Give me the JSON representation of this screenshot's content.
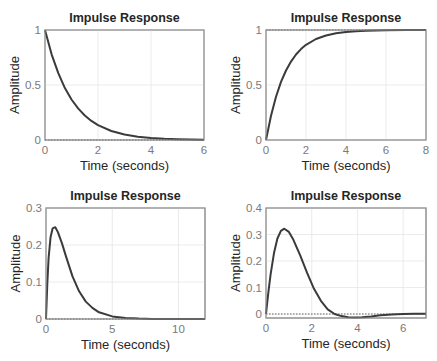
{
  "chart_data": [
    {
      "type": "line",
      "title": "Impulse Response",
      "xlabel": "Time (seconds)",
      "ylabel": "Amplitude",
      "xlim": [
        0,
        6
      ],
      "ylim": [
        0,
        1
      ],
      "xticks": [
        0,
        2,
        4,
        6
      ],
      "yticks": [
        0,
        0.5,
        1
      ],
      "ytick_labels": [
        "0",
        "0.5",
        "1"
      ],
      "grid": true,
      "reference_line": 0,
      "box": {
        "left": 45,
        "top": 30,
        "right": 204,
        "bottom": 140
      },
      "series": [
        {
          "name": "impulse",
          "x": [
            0,
            0.25,
            0.5,
            0.75,
            1,
            1.25,
            1.5,
            1.75,
            2,
            2.5,
            3,
            3.5,
            4,
            4.5,
            5,
            5.5,
            6
          ],
          "values": [
            1,
            0.779,
            0.607,
            0.472,
            0.368,
            0.287,
            0.223,
            0.174,
            0.135,
            0.082,
            0.05,
            0.03,
            0.018,
            0.011,
            0.007,
            0.004,
            0.002
          ]
        }
      ]
    },
    {
      "type": "line",
      "title": "Impulse Response",
      "xlabel": "Time (seconds)",
      "ylabel": "Amplitude",
      "xlim": [
        0,
        8
      ],
      "ylim": [
        0,
        1
      ],
      "xticks": [
        0,
        2,
        4,
        6,
        8
      ],
      "yticks": [
        0,
        0.5,
        1
      ],
      "ytick_labels": [
        "0",
        "0.5",
        "1"
      ],
      "grid": true,
      "reference_line": 1,
      "box": {
        "left": 266,
        "top": 30,
        "right": 426,
        "bottom": 140
      },
      "series": [
        {
          "name": "impulse",
          "x": [
            0,
            0.25,
            0.5,
            0.75,
            1,
            1.25,
            1.5,
            1.75,
            2,
            2.5,
            3,
            3.5,
            4,
            4.5,
            5,
            6,
            7,
            8
          ],
          "values": [
            0,
            0.221,
            0.393,
            0.528,
            0.632,
            0.713,
            0.777,
            0.826,
            0.865,
            0.918,
            0.95,
            0.97,
            0.982,
            0.989,
            0.993,
            0.998,
            0.999,
            1
          ]
        }
      ]
    },
    {
      "type": "line",
      "title": "Impulse Response",
      "xlabel": "Time (seconds)",
      "ylabel": "Amplitude",
      "xlim": [
        0,
        12
      ],
      "ylim": [
        0,
        0.3
      ],
      "xticks": [
        0,
        5,
        10
      ],
      "yticks": [
        0,
        0.1,
        0.2,
        0.3
      ],
      "ytick_labels": [
        "0",
        "0.1",
        "0.2",
        "0.3"
      ],
      "grid": true,
      "reference_line": 0,
      "box": {
        "left": 46,
        "top": 208,
        "right": 205,
        "bottom": 319
      },
      "series": [
        {
          "name": "impulse",
          "x": [
            0,
            0.1,
            0.2,
            0.35,
            0.5,
            0.7,
            0.9,
            1.2,
            1.5,
            2,
            2.5,
            3,
            3.5,
            4,
            5,
            6,
            7,
            8,
            10,
            12
          ],
          "values": [
            0,
            0.095,
            0.165,
            0.222,
            0.245,
            0.248,
            0.235,
            0.205,
            0.17,
            0.115,
            0.075,
            0.047,
            0.03,
            0.018,
            0.007,
            0.003,
            0.001,
            0,
            0,
            0
          ]
        }
      ]
    },
    {
      "type": "line",
      "title": "Impulse Response",
      "xlabel": "Time (seconds)",
      "ylabel": "Amplitude",
      "xlim": [
        0,
        7
      ],
      "ylim": [
        -0.015,
        0.4
      ],
      "xticks": [
        0,
        2,
        4,
        6
      ],
      "yticks": [
        0,
        0.1,
        0.2,
        0.3,
        0.4
      ],
      "ytick_labels": [
        "0",
        "0.1",
        "0.2",
        "0.3",
        "0.4"
      ],
      "grid": true,
      "reference_line": 0,
      "box": {
        "left": 266,
        "top": 208,
        "right": 426,
        "bottom": 318
      },
      "series": [
        {
          "name": "impulse",
          "x": [
            0,
            0.1,
            0.2,
            0.35,
            0.5,
            0.65,
            0.8,
            1,
            1.2,
            1.5,
            1.8,
            2.1,
            2.4,
            2.7,
            3,
            3.3,
            3.6,
            3.9,
            4.2,
            4.6,
            5,
            5.5,
            6,
            6.5,
            7
          ],
          "values": [
            0,
            0.08,
            0.15,
            0.23,
            0.285,
            0.314,
            0.322,
            0.31,
            0.28,
            0.22,
            0.155,
            0.095,
            0.05,
            0.018,
            0.0,
            -0.008,
            -0.012,
            -0.013,
            -0.012,
            -0.009,
            -0.005,
            -0.002,
            0.0,
            0.001,
            0.001
          ]
        }
      ]
    }
  ]
}
